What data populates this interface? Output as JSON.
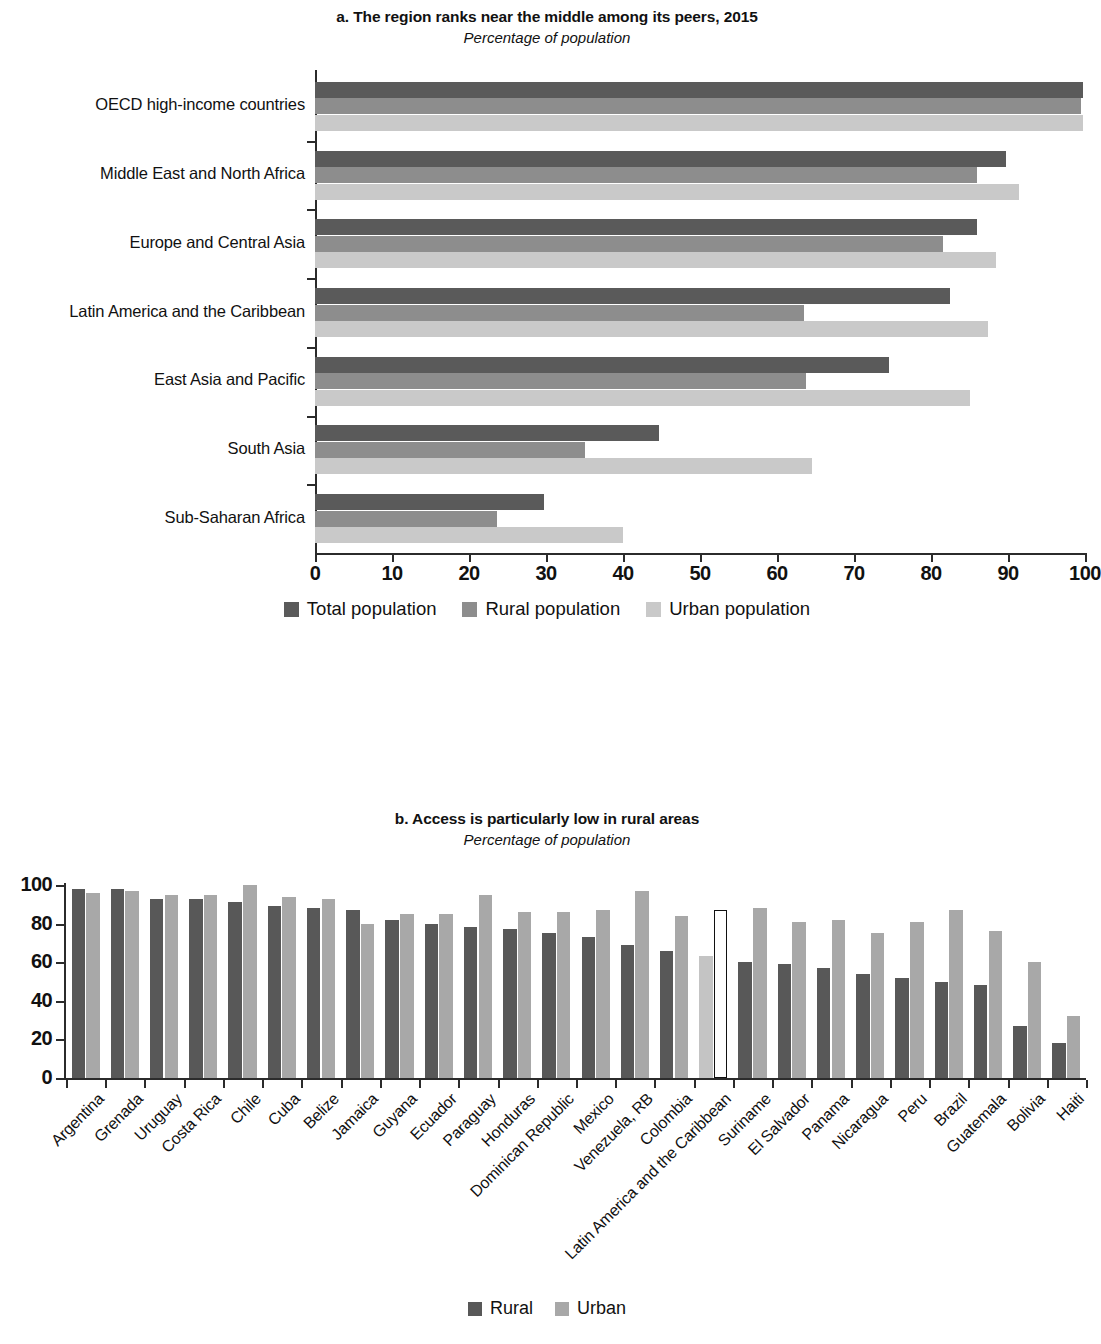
{
  "panel_a": {
    "title": "a. The region ranks near the middle among its peers, 2015",
    "subtitle": "Percentage of population",
    "legend": [
      {
        "label": "Total population",
        "color": "#5a5a5a"
      },
      {
        "label": "Rural population",
        "color": "#8d8d8d"
      },
      {
        "label": "Urban population",
        "color": "#c9c9c9"
      }
    ]
  },
  "panel_b": {
    "title": "b. Access is particularly low in rural areas",
    "subtitle": "Percentage of population",
    "legend": [
      {
        "label": "Rural",
        "color": "#585858"
      },
      {
        "label": "Urban",
        "color": "#a8a8a8"
      }
    ]
  },
  "chart_data": [
    {
      "type": "bar",
      "orientation": "horizontal",
      "title": "a. The region ranks near the middle among its peers, 2015",
      "subtitle": "Percentage of population",
      "xlabel": "",
      "ylabel": "",
      "xlim": [
        0,
        100
      ],
      "xticks": [
        0,
        10,
        20,
        30,
        40,
        50,
        60,
        70,
        80,
        90,
        100
      ],
      "grid": false,
      "legend_position": "bottom",
      "categories": [
        "OECD high-income countries",
        "Middle East and North Africa",
        "Europe and Central Asia",
        "Latin America and the Caribbean",
        "East Asia and Pacific",
        "South Asia",
        "Sub-Saharan Africa"
      ],
      "series": [
        {
          "name": "Total population",
          "color": "#5a5a5a",
          "values": [
            99.8,
            89.8,
            86.0,
            82.5,
            74.5,
            44.7,
            29.8
          ]
        },
        {
          "name": "Rural population",
          "color": "#8d8d8d",
          "values": [
            99.5,
            86.0,
            81.5,
            63.5,
            63.8,
            35.0,
            23.6
          ]
        },
        {
          "name": "Urban population",
          "color": "#c9c9c9",
          "values": [
            99.8,
            91.4,
            88.5,
            87.4,
            85.0,
            64.5,
            40.0
          ]
        }
      ]
    },
    {
      "type": "bar",
      "orientation": "vertical",
      "title": "b. Access is particularly low in rural areas",
      "subtitle": "Percentage of population",
      "xlabel": "",
      "ylabel": "",
      "ylim": [
        0,
        100
      ],
      "yticks": [
        0,
        20,
        40,
        60,
        80,
        100
      ],
      "grid": false,
      "legend_position": "bottom",
      "highlight_category": "Latin America and the Caribbean",
      "categories": [
        "Argentina",
        "Grenada",
        "Uruguay",
        "Costa Rica",
        "Chile",
        "Cuba",
        "Belize",
        "Jamaica",
        "Guyana",
        "Ecuador",
        "Paraguay",
        "Honduras",
        "Dominican Republic",
        "Mexico",
        "Venezuela, RB",
        "Colombia",
        "Latin America and the Caribbean",
        "Suriname",
        "El Salvador",
        "Panama",
        "Nicaragua",
        "Peru",
        "Brazil",
        "Guatemala",
        "Bolivia",
        "Haiti"
      ],
      "series": [
        {
          "name": "Rural",
          "color": "#585858",
          "values": [
            98,
            98,
            93,
            93,
            91,
            89,
            88,
            87,
            82,
            80,
            78,
            77,
            75,
            73,
            69,
            66,
            63,
            60,
            59,
            57,
            54,
            52,
            50,
            48,
            27,
            18
          ]
        },
        {
          "name": "Urban",
          "color": "#a8a8a8",
          "values": [
            96,
            97,
            95,
            95,
            100,
            94,
            93,
            80,
            85,
            85,
            95,
            86,
            86,
            87,
            97,
            84,
            87,
            88,
            81,
            82,
            75,
            81,
            87,
            76,
            60,
            32
          ]
        }
      ]
    }
  ]
}
